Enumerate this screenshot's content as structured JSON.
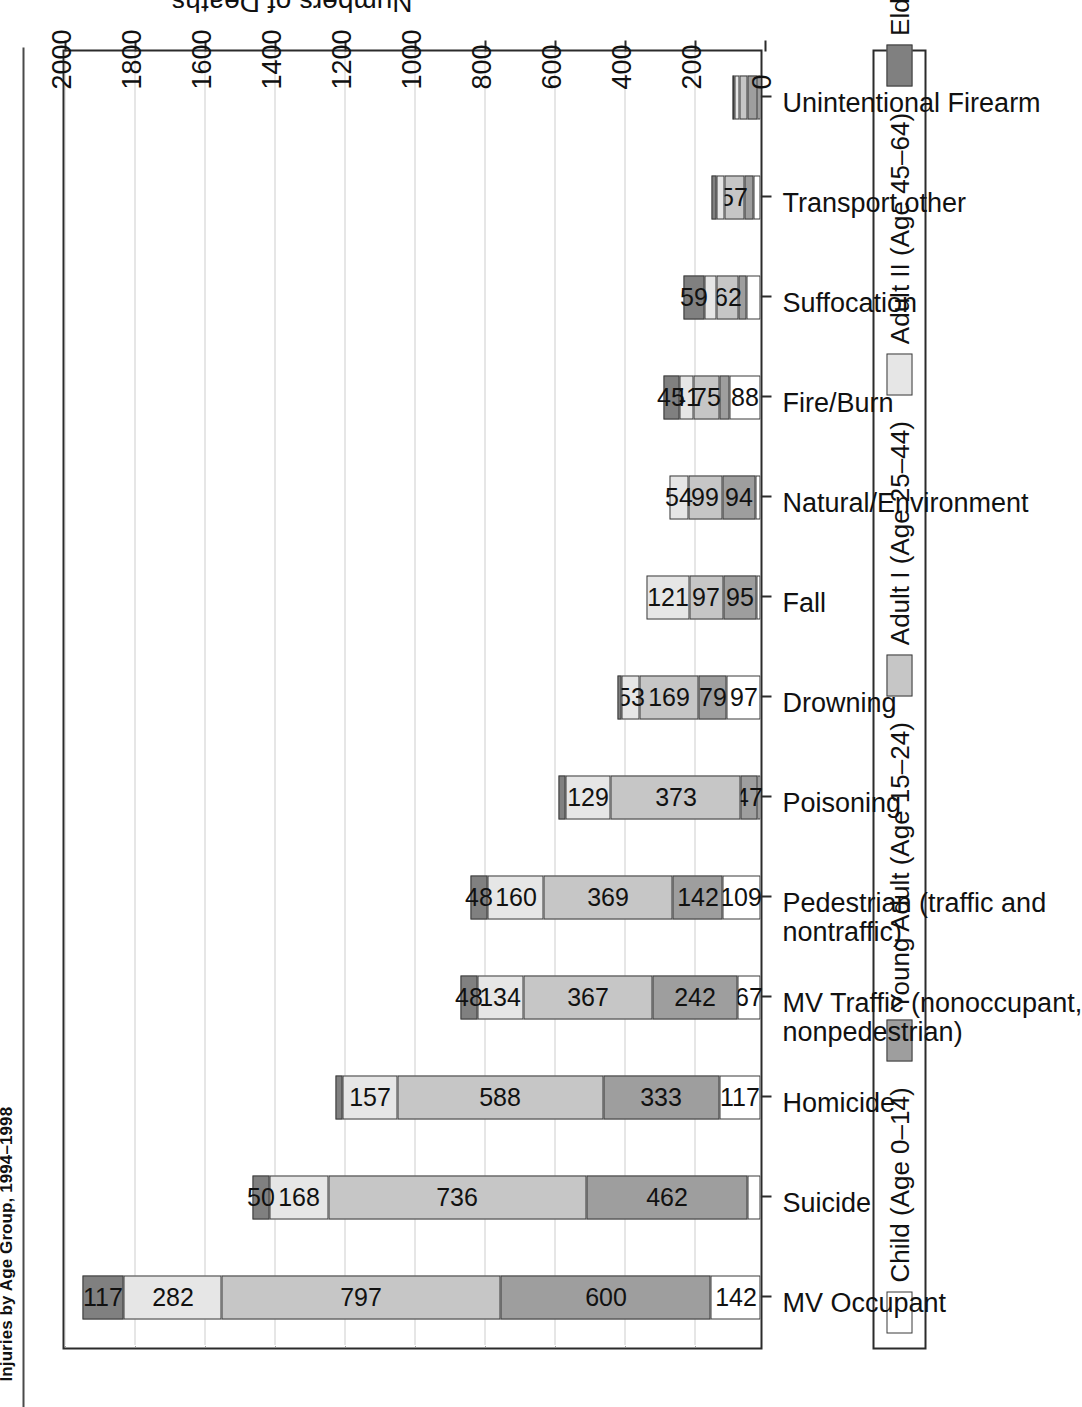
{
  "page": {
    "title": "Injuries by Age Group, 1994–1998"
  },
  "axis": {
    "y_title": "Numbers of Deaths",
    "ticks": [
      "0",
      "200",
      "400",
      "600",
      "800",
      "1000",
      "1200",
      "1400",
      "1600",
      "1800",
      "2000"
    ]
  },
  "legend": {
    "items": [
      {
        "label": "Child (Age 0–14)",
        "color": "#ffffff"
      },
      {
        "label": "Young Adult (Age 15–24)",
        "color": "#9e9e9e"
      },
      {
        "label": "Adult I (Age 25–44)",
        "color": "#c6c6c6"
      },
      {
        "label": "Adult II (Age 45–64)",
        "color": "#e6e6e6"
      },
      {
        "label": "Elder (Age 65+)",
        "color": "#808080"
      }
    ]
  },
  "chart_data": {
    "type": "bar",
    "orientation": "vertical-stacked",
    "title": "Injuries by Age Group, 1994–1998",
    "xlabel": "",
    "ylabel": "Numbers of Deaths",
    "ylim": [
      0,
      2000
    ],
    "ytick_step": 200,
    "grid": true,
    "legend_position": "bottom",
    "categories": [
      "MV Occupant",
      "Suicide",
      "Homicide",
      "MV Traffic (nonoccupant,\nnonpedestrian)",
      "Pedestrian (traffic and\nnontraffic)",
      "Poisoning",
      "Drowning",
      "Fall",
      "Natural/Environment",
      "Fire/Burn",
      "Suffocation",
      "Transport other",
      "Unintentional Firearm"
    ],
    "series": [
      {
        "name": "Child (Age 0–14)",
        "color": "#ffffff",
        "values": [
          142,
          36,
          117,
          67,
          109,
          9,
          97,
          12,
          14,
          88,
          41,
          20,
          8
        ]
      },
      {
        "name": "Young Adult (Age 15–24)",
        "color": "#9e9e9e",
        "values": [
          600,
          462,
          333,
          242,
          142,
          47,
          79,
          95,
          94,
          28,
          22,
          27,
          29
        ]
      },
      {
        "name": "Adult I (Age 25–44)",
        "color": "#c6c6c6",
        "values": [
          797,
          736,
          588,
          367,
          369,
          373,
          169,
          97,
          99,
          75,
          62,
          57,
          24
        ]
      },
      {
        "name": "Adult II (Age 45–64)",
        "color": "#e6e6e6",
        "values": [
          282,
          168,
          157,
          134,
          160,
          129,
          53,
          121,
          54,
          41,
          36,
          21,
          13
        ]
      },
      {
        "name": "Elder (Age 65+)",
        "color": "#808080",
        "values": [
          117,
          50,
          18,
          48,
          48,
          18,
          12,
          0,
          0,
          45,
          59,
          15,
          6
        ]
      }
    ],
    "segment_labels": [
      [
        "142",
        "600",
        "797",
        "282",
        "117"
      ],
      [
        "",
        "462",
        "736",
        "168",
        "50"
      ],
      [
        "117",
        "333",
        "588",
        "157",
        ""
      ],
      [
        "67",
        "242",
        "367",
        "134",
        "48"
      ],
      [
        "109",
        "142",
        "369",
        "160",
        "48"
      ],
      [
        "",
        "47",
        "373",
        "129",
        ""
      ],
      [
        "97",
        "79",
        "169",
        "53",
        ""
      ],
      [
        "",
        "95",
        "97",
        "121",
        ""
      ],
      [
        "",
        "94",
        "99",
        "54",
        ""
      ],
      [
        "88",
        "",
        "75",
        "41",
        "45"
      ],
      [
        "",
        "",
        "62",
        "",
        "59"
      ],
      [
        "",
        "",
        "57",
        "",
        ""
      ],
      [
        "",
        "",
        "",
        "",
        ""
      ]
    ],
    "totals": [
      1938,
      1452,
      1213,
      858,
      828,
      576,
      410,
      325,
      261,
      277,
      220,
      140,
      80
    ]
  }
}
